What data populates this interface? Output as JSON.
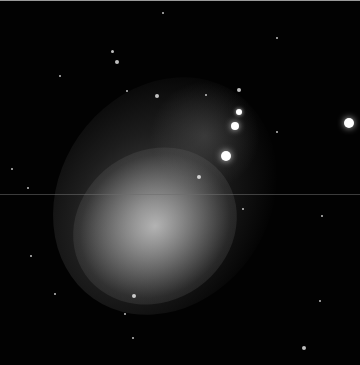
{
  "image": {
    "subject": "irregular dwarf galaxy star field",
    "background_color": "#020202",
    "glow_color": "#c8c8c8"
  },
  "stars": [
    {
      "x": 349,
      "y": 122,
      "r": 5
    },
    {
      "x": 226,
      "y": 155,
      "r": 5
    },
    {
      "x": 235,
      "y": 125,
      "r": 4
    },
    {
      "x": 239,
      "y": 111,
      "r": 3
    },
    {
      "x": 117,
      "y": 61,
      "r": 2
    },
    {
      "x": 157,
      "y": 95,
      "r": 2
    },
    {
      "x": 199,
      "y": 176,
      "r": 2
    },
    {
      "x": 134,
      "y": 295,
      "r": 2
    },
    {
      "x": 304,
      "y": 347,
      "r": 2
    },
    {
      "x": 239,
      "y": 89,
      "r": 2
    },
    {
      "x": 112,
      "y": 50,
      "r": 1.5
    },
    {
      "x": 60,
      "y": 75,
      "r": 1
    },
    {
      "x": 28,
      "y": 187,
      "r": 1
    },
    {
      "x": 12,
      "y": 168,
      "r": 1
    },
    {
      "x": 322,
      "y": 215,
      "r": 1
    },
    {
      "x": 277,
      "y": 131,
      "r": 1
    },
    {
      "x": 206,
      "y": 94,
      "r": 1
    },
    {
      "x": 127,
      "y": 90,
      "r": 1
    },
    {
      "x": 55,
      "y": 293,
      "r": 1
    },
    {
      "x": 31,
      "y": 255,
      "r": 1
    },
    {
      "x": 243,
      "y": 208,
      "r": 1
    },
    {
      "x": 133,
      "y": 337,
      "r": 1
    },
    {
      "x": 125,
      "y": 313,
      "r": 1
    },
    {
      "x": 163,
      "y": 12,
      "r": 1
    },
    {
      "x": 277,
      "y": 37,
      "r": 1
    },
    {
      "x": 320,
      "y": 300,
      "r": 1
    }
  ]
}
